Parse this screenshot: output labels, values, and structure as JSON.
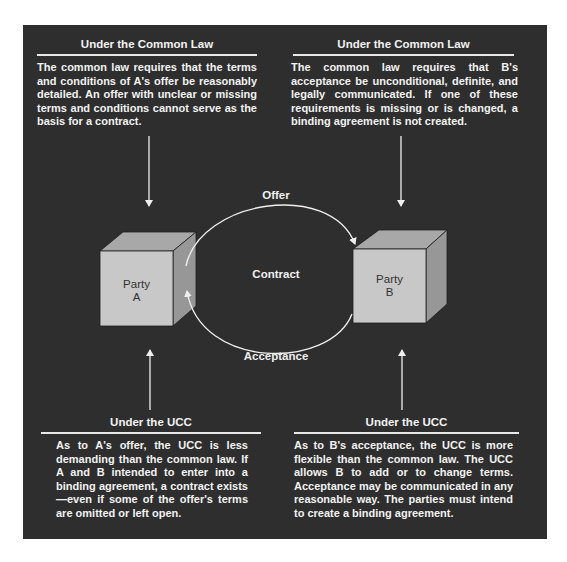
{
  "boxes": {
    "top_left": {
      "title": "Under the Common Law",
      "text": "The common law requires that the terms and conditions of A's offer be reasonably detailed. An offer with unclear or missing terms and conditions cannot serve as the basis for a contract."
    },
    "top_right": {
      "title": "Under the Common Law",
      "text": "The common law requires that B's acceptance be unconditional, definite, and legally communicated. If one of these requirements is missing or is changed, a binding agreement is not created."
    },
    "bottom_left": {
      "title": "Under the UCC",
      "text": "As to A's offer, the UCC is less demanding than the common law. If A and B intended to enter into a binding agreement, a contract exists—even if some of the offer's terms are omitted or left open."
    },
    "bottom_right": {
      "title": "Under the UCC",
      "text": "As to B's acceptance, the UCC is more flexible than the common law. The UCC allows B to add or to change terms. Acceptance may be communicated in any reasonable way. The parties must intend to create a binding agreement."
    }
  },
  "diagram": {
    "party_a": {
      "line1": "Party",
      "line2": "A"
    },
    "party_b": {
      "line1": "Party",
      "line2": "B"
    },
    "offer_label": "Offer",
    "contract_label": "Contract",
    "acceptance_label": "Acceptance"
  },
  "colors": {
    "background": "#2e2e2e",
    "text": "#f2f2f2",
    "cube_front": "#c9c9c9",
    "cube_top": "#a9a9a9",
    "cube_side": "#9a9a9a"
  }
}
